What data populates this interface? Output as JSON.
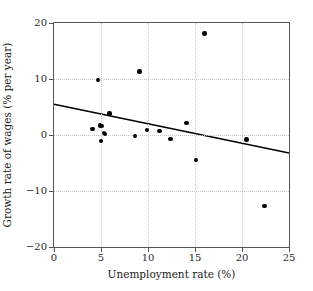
{
  "chart_data": {
    "type": "scatter",
    "title": "",
    "xlabel": "Unemployment rate (%)",
    "ylabel": "Growth rate of wages (% per year)",
    "xlim": [
      0,
      25
    ],
    "ylim": [
      -20,
      20
    ],
    "xticks": [
      0,
      5,
      10,
      15,
      20,
      25
    ],
    "yticks": [
      -20,
      -10,
      0,
      10,
      20
    ],
    "xticklabels": [
      "0",
      "5",
      "10",
      "15",
      "20",
      "25"
    ],
    "yticklabels": [
      "−20",
      "−10",
      "0",
      "10",
      "20"
    ],
    "grid": true,
    "legend": null,
    "series": [
      {
        "name": "observations",
        "marker": "filled-circle",
        "color": "#000000",
        "points": [
          {
            "x": 4.1,
            "y": 1.1
          },
          {
            "x": 4.7,
            "y": 9.8
          },
          {
            "x": 4.9,
            "y": 1.7
          },
          {
            "x": 5.1,
            "y": 1.6
          },
          {
            "x": 5.0,
            "y": -1.1
          },
          {
            "x": 5.3,
            "y": 0.4
          },
          {
            "x": 5.4,
            "y": 0.2
          },
          {
            "x": 5.9,
            "y": 3.8
          },
          {
            "x": 8.6,
            "y": -0.2
          },
          {
            "x": 9.1,
            "y": 11.3
          },
          {
            "x": 9.9,
            "y": 0.9
          },
          {
            "x": 11.2,
            "y": 0.7
          },
          {
            "x": 12.4,
            "y": -0.7
          },
          {
            "x": 14.1,
            "y": 2.1
          },
          {
            "x": 15.1,
            "y": -4.5
          },
          {
            "x": 16.0,
            "y": 18.1
          },
          {
            "x": 20.5,
            "y": -0.8
          },
          {
            "x": 22.4,
            "y": -12.7
          }
        ]
      }
    ],
    "trendline": {
      "name": "fitted regression line",
      "color": "#000000",
      "x_start": 0,
      "y_start": 5.5,
      "x_end": 25,
      "y_end": -3.2
    }
  }
}
